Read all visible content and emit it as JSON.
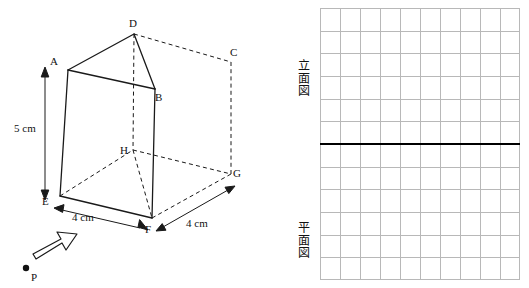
{
  "diagram": {
    "vertices": [
      {
        "id": "A",
        "label": "A",
        "x": 56,
        "y": 62
      },
      {
        "id": "D",
        "label": "D",
        "x": 133,
        "y": 24
      },
      {
        "id": "C",
        "label": "C",
        "x": 232,
        "y": 54
      },
      {
        "id": "B",
        "label": "B",
        "x": 155,
        "y": 98
      },
      {
        "id": "H",
        "label": "H",
        "x": 124,
        "y": 155
      },
      {
        "id": "G",
        "label": "G",
        "x": 235,
        "y": 176
      },
      {
        "id": "E",
        "label": "E",
        "x": 48,
        "y": 199
      },
      {
        "id": "F",
        "label": "F",
        "x": 148,
        "y": 227
      }
    ],
    "measurements": [
      {
        "id": "height",
        "label": "5 cm",
        "x": 18,
        "y": 128
      },
      {
        "id": "front-width",
        "label": "4 cm",
        "x": 75,
        "y": 215
      },
      {
        "id": "depth",
        "label": "4 cm",
        "x": 188,
        "y": 222
      }
    ],
    "point_p": {
      "label": "P",
      "x": 34,
      "y": 275
    },
    "arrow": {
      "name": "direction-arrow"
    }
  },
  "grid": {
    "cols": 10,
    "rows": 12,
    "divider_row": 6,
    "labels": [
      {
        "id": "front-view",
        "text": "立面図",
        "x": 300,
        "y": 66
      },
      {
        "id": "top-view",
        "text": "平面図",
        "x": 300,
        "y": 228
      }
    ]
  },
  "colors": {
    "line": "#1a1a1a",
    "grid": "#b8b8b8",
    "divider": "#000000"
  }
}
